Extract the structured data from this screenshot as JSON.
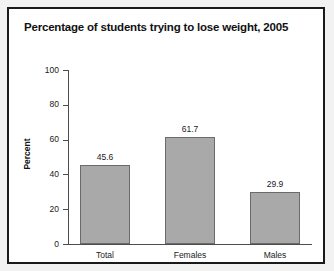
{
  "figure": {
    "title": "Percentage of students trying to lose weight, 2005",
    "frame_color": "#1a1a1a",
    "background": "#ffffff"
  },
  "chart_data": {
    "type": "bar",
    "title": "Percentage of students trying to lose weight, 2005",
    "xlabel": "",
    "ylabel": "Percent",
    "categories": [
      "Total",
      "Females",
      "Males"
    ],
    "values": [
      45.6,
      61.7,
      29.9
    ],
    "value_labels": [
      "45.6",
      "61.7",
      "29.9"
    ],
    "ylim": [
      0,
      100
    ],
    "yticks": [
      0,
      20,
      40,
      60,
      80,
      100
    ],
    "ytick_labels": [
      "0",
      "20",
      "40",
      "60",
      "80",
      "100"
    ],
    "grid": false,
    "legend": false,
    "bar_color": "#a9a9a9",
    "bar_edge_color": "#6b6b6b"
  }
}
